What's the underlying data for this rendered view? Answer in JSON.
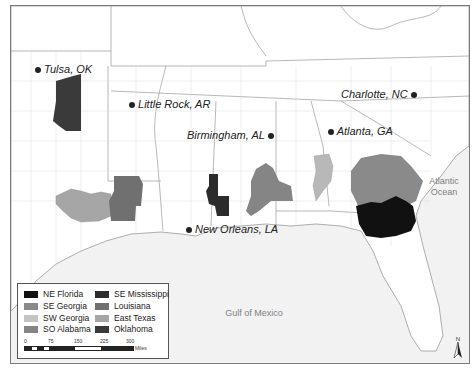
{
  "map": {
    "cities": [
      {
        "name": "Tulsa, OK",
        "x": 28,
        "y": 62,
        "dot_side": "left"
      },
      {
        "name": "Little Rock, AR",
        "x": 122,
        "y": 97,
        "dot_side": "left"
      },
      {
        "name": "Birmingham, AL",
        "x": 176,
        "y": 128,
        "dot_side": "right"
      },
      {
        "name": "Atlanta, GA",
        "x": 320,
        "y": 124,
        "dot_side": "left"
      },
      {
        "name": "Charlotte, NC",
        "x": 345,
        "y": 88,
        "dot_side": "right"
      },
      {
        "name": "New Orleans, LA",
        "x": 178,
        "y": 222,
        "dot_side": "left"
      }
    ],
    "water_labels": [
      {
        "name": "Atlantic\nOcean",
        "x": 390,
        "y": 196
      },
      {
        "name": "Gulf of Mexico",
        "x": 205,
        "y": 304
      }
    ],
    "colors": {
      "ne_florida": "#111111",
      "se_mississippi": "#2b2b2b",
      "se_georgia": "#8a8a8a",
      "louisiana": "#707070",
      "sw_georgia": "#b8b8b8",
      "east_texas": "#a6a6a6",
      "so_alabama": "#858585",
      "oklahoma": "#3a3a3a",
      "water": "#f2f2f2",
      "land": "#ffffff",
      "border": "#b0b0b0"
    }
  },
  "legend": {
    "items": [
      {
        "label": "NE Florida",
        "color": "#111111"
      },
      {
        "label": "SE Mississippi",
        "color": "#2b2b2b"
      },
      {
        "label": "SE Georgia",
        "color": "#8a8a8a"
      },
      {
        "label": "Louisiana",
        "color": "#707070"
      },
      {
        "label": "SW Georgia",
        "color": "#c4c4c4"
      },
      {
        "label": "East Texas",
        "color": "#a6a6a6"
      },
      {
        "label": "SO Alabama",
        "color": "#858585"
      },
      {
        "label": "Oklahoma",
        "color": "#3a3a3a"
      }
    ],
    "scale": {
      "ticks": [
        "0",
        "75",
        "150",
        "225",
        "300"
      ],
      "unit": "Miles"
    }
  },
  "north_arrow": {
    "label": "N"
  }
}
